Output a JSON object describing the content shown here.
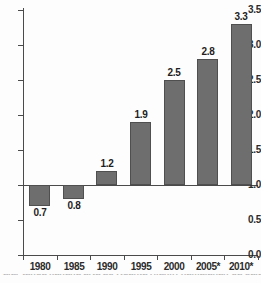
{
  "chart_data": {
    "type": "bar",
    "title": "",
    "subtitle": "",
    "xlabel": "",
    "ylabel": "",
    "categories": [
      "1980",
      "1985",
      "1990",
      "1995",
      "2000",
      "2005*",
      "2010*"
    ],
    "values": [
      0.7,
      0.8,
      1.2,
      1.9,
      2.5,
      2.8,
      3.3
    ],
    "data_labels": [
      "0.7",
      "0.8",
      "1.2",
      "1.9",
      "2.5",
      "2.8",
      "3.3"
    ],
    "ylim": [
      0.0,
      3.5
    ],
    "ytick_labels": [
      "0.0",
      "0.5",
      "1.0",
      "1.5",
      "2.0",
      "2.5",
      "3.0",
      "3.5"
    ],
    "ytick_values": [
      0.0,
      0.5,
      1.0,
      1.5,
      2.0,
      2.5,
      3.0,
      3.5
    ],
    "baseline": 1.0,
    "grid": false,
    "legend": null,
    "legend_position": "none",
    "bar_color": "#6e6e6e",
    "bar_edge_color": "#4f4f4f",
    "axis_color": "#4a4a4a",
    "text_color": "#2b2b2b",
    "background_color": "#fdfdfd"
  },
  "caption": {
    "cut_off_text": "alar tanda kanana arta ad Kuanta rilahiri namalanan da dalam"
  }
}
